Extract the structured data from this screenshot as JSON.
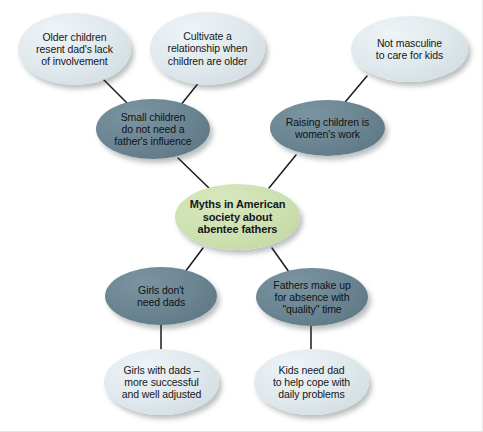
{
  "diagram": {
    "type": "mind-map",
    "title": "Myths in American society about abentee fathers",
    "background_color": "#ffffff",
    "colors": {
      "center_node": "#cde0b0",
      "mid_node": "#6a8492",
      "leaf_node": "#dfe8ec",
      "connector": "#1b1b1b",
      "text": "#14171a"
    },
    "nodes": [
      {
        "id": "center",
        "tier": "center",
        "label": "Myths in American\nsociety about\nabentee fathers"
      },
      {
        "id": "small-children",
        "tier": "mid",
        "label": "Small children\ndo not need a\nfather's influence"
      },
      {
        "id": "raising-children",
        "tier": "mid",
        "label": "Raising children is\nwomen's work"
      },
      {
        "id": "girls-dont-need-dads",
        "tier": "mid",
        "label": "Girls don't\nneed dads"
      },
      {
        "id": "fathers-make-up",
        "tier": "mid",
        "label": "Fathers make up\nfor absence with\n\"quality\" time"
      },
      {
        "id": "older-children",
        "tier": "leaf",
        "label": "Older children\nresent dad's lack\nof involvement"
      },
      {
        "id": "cultivate",
        "tier": "leaf",
        "label": "Cultivate a\nrelationship when\nchildren are older"
      },
      {
        "id": "not-masculine",
        "tier": "leaf",
        "label": "Not masculine\nto care for kids"
      },
      {
        "id": "girls-with-dads",
        "tier": "leaf",
        "label": "Girls with dads –\nmore successful\nand well adjusted"
      },
      {
        "id": "kids-need-dad",
        "tier": "leaf",
        "label": "Kids need dad\nto help cope with\ndaily problems"
      }
    ],
    "edges": [
      {
        "from": "older-children",
        "to": "small-children"
      },
      {
        "from": "cultivate",
        "to": "small-children"
      },
      {
        "from": "small-children",
        "to": "center"
      },
      {
        "from": "not-masculine",
        "to": "raising-children"
      },
      {
        "from": "raising-children",
        "to": "center"
      },
      {
        "from": "center",
        "to": "girls-dont-need-dads"
      },
      {
        "from": "center",
        "to": "fathers-make-up"
      },
      {
        "from": "girls-dont-need-dads",
        "to": "girls-with-dads"
      },
      {
        "from": "fathers-make-up",
        "to": "kids-need-dad"
      }
    ]
  }
}
